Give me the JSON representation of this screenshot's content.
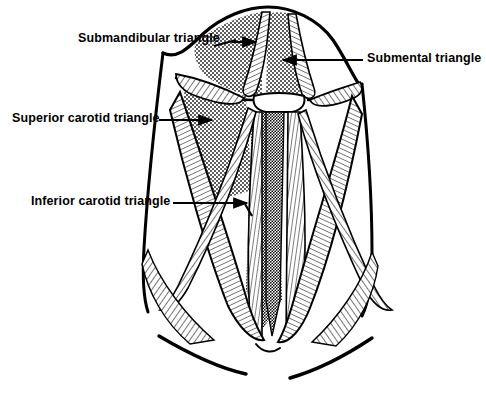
{
  "figure": {
    "view": "anterior",
    "style": "black and white line engraving with stipple and hatch shading",
    "background_color": "#ffffff",
    "ink_color": "#000000",
    "stipple_color": "#2b2b2b",
    "width": 486,
    "height": 393
  },
  "labels": {
    "submandibular": "Submandibular triangle",
    "submental": "Submental triangle",
    "superior_carotid": "Superior carotid triangle",
    "inferior_carotid": "Inferior carotid triangle"
  },
  "annotations": [
    {
      "name": "submandibular-triangle",
      "text": "Submandibular triangle",
      "text_x": 78,
      "text_y": 32,
      "leader": {
        "x1": 232,
        "y1": 42,
        "x2": 256,
        "y2": 42,
        "direction": "right"
      }
    },
    {
      "name": "submental-triangle",
      "text": "Submental triangle",
      "text_x": 367,
      "text_y": 52,
      "leader": {
        "x1": 363,
        "y1": 60,
        "x2": 282,
        "y2": 60,
        "direction": "left"
      }
    },
    {
      "name": "superior-carotid-triangle",
      "text": "Superior carotid triangle",
      "text_x": 12,
      "text_y": 112,
      "leader": {
        "x1": 159,
        "y1": 120,
        "x2": 214,
        "y2": 120,
        "direction": "right"
      }
    },
    {
      "name": "inferior-carotid-triangle",
      "text": "Inferior carotid triangle",
      "text_x": 31,
      "text_y": 195,
      "leader": {
        "x1": 173,
        "y1": 203,
        "x2": 249,
        "y2": 203,
        "direction": "right"
      }
    }
  ],
  "regions": [
    {
      "name": "submandibular-triangle-region",
      "shading": "stipple",
      "side": "left"
    },
    {
      "name": "submental-triangle-region",
      "shading": "stipple",
      "side": "midline"
    },
    {
      "name": "superior-carotid-triangle-region",
      "shading": "stipple",
      "side": "left"
    },
    {
      "name": "inferior-carotid-triangle-region",
      "shading": "stipple",
      "side": "midline-left"
    }
  ],
  "structures": [
    {
      "name": "mandible-border",
      "kind": "outline"
    },
    {
      "name": "digastric-anterior-belly-left",
      "kind": "muscle"
    },
    {
      "name": "digastric-anterior-belly-right",
      "kind": "muscle"
    },
    {
      "name": "digastric-posterior-belly-left",
      "kind": "muscle"
    },
    {
      "name": "digastric-posterior-belly-right",
      "kind": "muscle"
    },
    {
      "name": "hyoid-bone",
      "kind": "bone"
    },
    {
      "name": "sternocleidomastoid-left",
      "kind": "muscle"
    },
    {
      "name": "sternocleidomastoid-right",
      "kind": "muscle"
    },
    {
      "name": "omohyoid-left",
      "kind": "muscle"
    },
    {
      "name": "omohyoid-right",
      "kind": "muscle"
    },
    {
      "name": "sternohyoid-left",
      "kind": "muscle"
    },
    {
      "name": "sternohyoid-right",
      "kind": "muscle"
    },
    {
      "name": "trachea-midline",
      "kind": "midline-structure"
    },
    {
      "name": "clavicle-left",
      "kind": "bone"
    },
    {
      "name": "clavicle-right",
      "kind": "bone"
    },
    {
      "name": "neck-contour-left",
      "kind": "outline"
    },
    {
      "name": "neck-contour-right",
      "kind": "outline"
    }
  ]
}
